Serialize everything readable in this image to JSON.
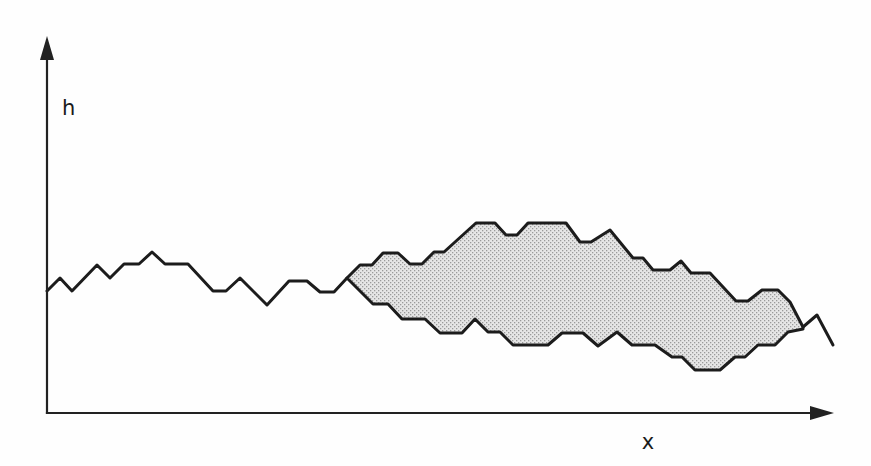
{
  "figure": {
    "y_axis_label": "h",
    "x_axis_label": "x",
    "colors": {
      "background": "#fefefe",
      "line": "#1c1c1c",
      "axis": "#222222",
      "stipple_dot": "#9a9a9a",
      "stipple_background": "#e6e6e6"
    },
    "axes": {
      "origin": [
        47,
        413
      ],
      "y_tip": [
        47,
        36
      ],
      "x_tip": [
        834,
        413
      ]
    },
    "interface_path": [
      [
        47,
        291
      ],
      [
        60,
        278
      ],
      [
        72,
        291
      ],
      [
        97,
        265
      ],
      [
        110,
        278
      ],
      [
        124,
        264
      ],
      [
        139,
        264
      ],
      [
        152,
        252
      ],
      [
        165,
        264
      ],
      [
        188,
        264
      ],
      [
        213,
        291
      ],
      [
        226,
        291
      ],
      [
        240,
        278
      ],
      [
        267,
        305
      ],
      [
        289,
        281
      ],
      [
        307,
        281
      ],
      [
        320,
        292
      ],
      [
        334,
        292
      ],
      [
        347,
        278
      ]
    ],
    "droplet": {
      "upper_boundary": [
        [
          347,
          278
        ],
        [
          360,
          265
        ],
        [
          372,
          265
        ],
        [
          383,
          253
        ],
        [
          398,
          253
        ],
        [
          410,
          264
        ],
        [
          422,
          264
        ],
        [
          434,
          252
        ],
        [
          444,
          252
        ],
        [
          476,
          223
        ],
        [
          495,
          223
        ],
        [
          506,
          235
        ],
        [
          517,
          235
        ],
        [
          528,
          223
        ],
        [
          566,
          223
        ],
        [
          580,
          242
        ],
        [
          591,
          242
        ],
        [
          610,
          230
        ],
        [
          633,
          258
        ],
        [
          643,
          258
        ],
        [
          653,
          270
        ],
        [
          670,
          270
        ],
        [
          681,
          261
        ],
        [
          691,
          273
        ],
        [
          710,
          273
        ],
        [
          736,
          301
        ],
        [
          748,
          301
        ],
        [
          762,
          290
        ],
        [
          778,
          290
        ],
        [
          790,
          302
        ],
        [
          803,
          327
        ]
      ],
      "lower_boundary": [
        [
          347,
          278
        ],
        [
          373,
          304
        ],
        [
          388,
          304
        ],
        [
          402,
          319
        ],
        [
          425,
          319
        ],
        [
          440,
          333
        ],
        [
          462,
          333
        ],
        [
          475,
          319
        ],
        [
          488,
          332
        ],
        [
          500,
          332
        ],
        [
          513,
          345
        ],
        [
          548,
          345
        ],
        [
          562,
          333
        ],
        [
          583,
          333
        ],
        [
          598,
          346
        ],
        [
          617,
          332
        ],
        [
          632,
          345
        ],
        [
          655,
          345
        ],
        [
          672,
          357
        ],
        [
          682,
          357
        ],
        [
          695,
          370
        ],
        [
          720,
          370
        ],
        [
          735,
          357
        ],
        [
          745,
          357
        ],
        [
          758,
          345
        ],
        [
          775,
          345
        ],
        [
          788,
          332
        ],
        [
          803,
          329
        ]
      ]
    },
    "tail_path": [
      [
        803,
        327
      ],
      [
        817,
        315
      ],
      [
        833,
        345
      ]
    ]
  }
}
